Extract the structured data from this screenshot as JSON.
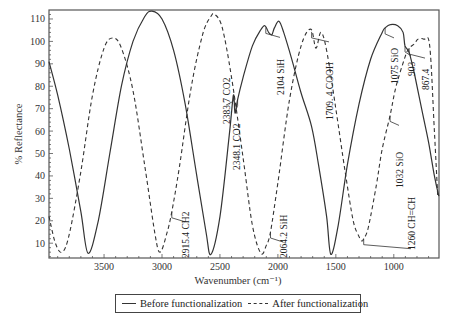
{
  "chart_data": {
    "type": "line",
    "title": "",
    "xlabel": "Wavenumber (cm⁻¹)",
    "ylabel": "% Reflectance",
    "xlim": [
      3975,
      610
    ],
    "ylim": [
      3.4,
      114
    ],
    "x_reversed": true,
    "grid": false,
    "xticks": [
      3500,
      3000,
      2500,
      2000,
      1500,
      1000
    ],
    "yticks": [
      10,
      20,
      30,
      40,
      50,
      60,
      70,
      80,
      90,
      100,
      110
    ],
    "legend_position": "bottom-center",
    "series": [
      {
        "name": "Before functionalization",
        "style": "solid",
        "x": [
          3975,
          3900,
          3800,
          3700,
          3638,
          3550,
          3450,
          3350,
          3250,
          3150,
          3086,
          3000,
          2900,
          2800,
          2700,
          2620,
          2578,
          2500,
          2420,
          2383.7,
          2370,
          2348.1,
          2300,
          2220,
          2150,
          2112,
          2080,
          2052,
          2030,
          1991,
          1950,
          1880,
          1800,
          1709,
          1650,
          1580,
          1543,
          1480,
          1400,
          1300,
          1200,
          1100,
          1075,
          1030,
          966,
          920,
          903,
          867,
          820,
          760,
          700,
          650,
          612
        ],
        "y": [
          91,
          76,
          52,
          24,
          5.5,
          20,
          50,
          80,
          100,
          111,
          113.5,
          110,
          96,
          72,
          40,
          15,
          5,
          22,
          58,
          76,
          68,
          74,
          84,
          98,
          105,
          107,
          104,
          103,
          106,
          109,
          104,
          92,
          77,
          62,
          45,
          22,
          5,
          18,
          45,
          72,
          92,
          104,
          106,
          107.5,
          107,
          104,
          98,
          95,
          85,
          70,
          55,
          40,
          31
        ]
      },
      {
        "name": "After functionalization",
        "style": "dashed",
        "x": [
          3975,
          3920,
          3862,
          3800,
          3700,
          3600,
          3500,
          3422,
          3350,
          3250,
          3150,
          3060,
          3017,
          2960,
          2915.4,
          2850,
          2750,
          2650,
          2580,
          2543,
          2480,
          2400,
          2300,
          2220,
          2147,
          2100,
          2064.2,
          2000,
          1900,
          1800,
          1716,
          1672,
          1629,
          1580,
          1500,
          1420,
          1350,
          1300,
          1276,
          1260,
          1220,
          1150,
          1100,
          1032,
          980,
          903,
          867.4,
          820,
          793,
          740,
          690,
          650,
          621
        ],
        "y": [
          22,
          10,
          6,
          14,
          42,
          76,
          97,
          101.5,
          97,
          78,
          45,
          14,
          6,
          14,
          24,
          44,
          79,
          103,
          111,
          112,
          106,
          84,
          48,
          18,
          5.5,
          9,
          15,
          37,
          74,
          98,
          105.5,
          97,
          104,
          96,
          70,
          42,
          20,
          13,
          11,
          12,
          17,
          36,
          52,
          67,
          80,
          93,
          97,
          99,
          101,
          101,
          98,
          60,
          31
        ]
      }
    ],
    "annotations": [
      {
        "text": "2915.4 CH2",
        "series": "After functionalization",
        "x": 2915.4
      },
      {
        "text": "2383.7 CO2",
        "series": "Before functionalization",
        "x": 2383.7
      },
      {
        "text": "2348.1 CO2",
        "series": "Before functionalization",
        "x": 2348.1
      },
      {
        "text": "2104 SiH",
        "series": "Before functionalization",
        "x": 2104
      },
      {
        "text": "2064.2 SiH",
        "series": "After functionalization",
        "x": 2064.2
      },
      {
        "text": "1709. 4 COOH",
        "series": "After functionalization",
        "x": 1709.4
      },
      {
        "text": "1260 CH=CH",
        "series": "After functionalization",
        "x": 1260
      },
      {
        "text": "1075 SiO",
        "series": "Before functionalization",
        "x": 1075
      },
      {
        "text": "1032 SiO",
        "series": "After functionalization",
        "x": 1032
      },
      {
        "text": "903",
        "series": "Before functionalization",
        "x": 903
      },
      {
        "text": "867.4",
        "series": "After functionalization",
        "x": 867.4
      }
    ]
  },
  "legend": {
    "before_label": "Before functionalization",
    "after_label": "After functionalization"
  }
}
